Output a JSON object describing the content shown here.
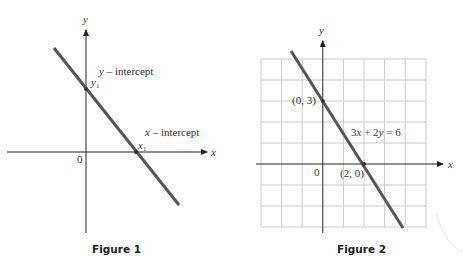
{
  "figure1": {
    "caption": "Figure 1",
    "x_axis_label": "x",
    "y_axis_label": "y",
    "origin_label": "0",
    "y_intercept_label": "y – intercept",
    "y_intercept_point_label": "y",
    "y_intercept_point_sub": "1",
    "x_intercept_label": "x – intercept",
    "x_intercept_point_label": "x",
    "x_intercept_point_sub": "1"
  },
  "figure2": {
    "caption": "Figure 2",
    "x_axis_label": "x",
    "y_axis_label": "y",
    "origin_label": "0",
    "equation_label": "3x + 2y = 6",
    "point_y_intercept_label": "(0, 3)",
    "point_x_intercept_label": "(2, 0)"
  },
  "colors": {
    "line": "#555555",
    "axis": "#222222",
    "grid": "#cccccc"
  }
}
